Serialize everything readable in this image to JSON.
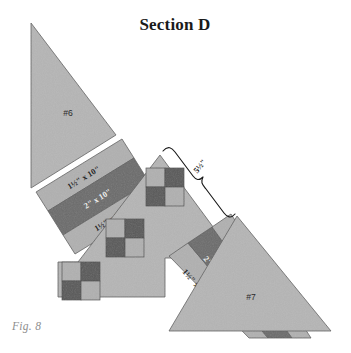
{
  "figure": {
    "title": "Section D",
    "caption": "Fig. 8",
    "type": "quilt-piecing-diagram"
  },
  "pieces": {
    "triangle_upper_left": {
      "label": "#6",
      "fill": "#b5b5b5"
    },
    "triangle_lower_right": {
      "label": "#7",
      "fill": "#b5b5b5"
    },
    "center_field": {
      "fill": "#b5b5b5"
    }
  },
  "strip_sets": {
    "upper": {
      "strips": [
        {
          "label": "1½\" x 10\"",
          "fill": "#b0b0b0",
          "tone": "light"
        },
        {
          "label": "2\" x 10\"",
          "fill": "#6b6b6b",
          "tone": "dark"
        },
        {
          "label": "1½\" x 10\"",
          "fill": "#b0b0b0",
          "tone": "light"
        }
      ]
    },
    "lower": {
      "strips": [
        {
          "label": "1½\" x 10\"",
          "fill": "#b0b0b0",
          "tone": "light"
        },
        {
          "label": "2\" x 10\"",
          "fill": "#6b6b6b",
          "tone": "dark"
        },
        {
          "label": "1½\" x 10\"",
          "fill": "#b0b0b0",
          "tone": "light"
        }
      ]
    }
  },
  "annotation": {
    "brace_measurement": "5½\""
  },
  "checker_blocks": {
    "count": 3,
    "pattern": "2x2-four-patch",
    "squares": [
      "light",
      "dark",
      "dark",
      "light"
    ],
    "colors": {
      "light": "#b0b0b0",
      "dark": "#585858"
    }
  },
  "palette": {
    "background": "#ffffff",
    "light_gray": "#b5b5b5",
    "mid_gray": "#b0b0b0",
    "dark_gray": "#6b6b6b",
    "darkest_gray": "#585858",
    "outline": "#5c5c5c",
    "title_color": "#1a1a1a",
    "caption_color": "#8e8e8e"
  }
}
